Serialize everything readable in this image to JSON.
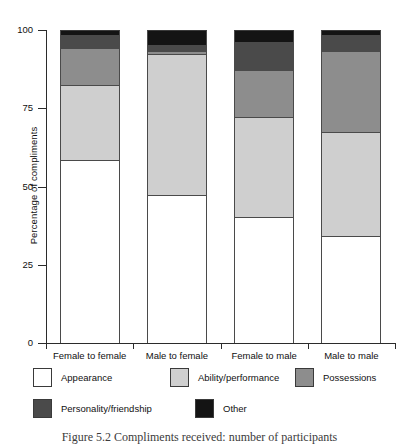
{
  "chart_data": {
    "type": "bar",
    "subtype": "stacked-bar-100-percent",
    "title": "",
    "xlabel": "",
    "ylabel": "Percentage of compliments",
    "ylim": [
      0,
      100
    ],
    "yticks": [
      0,
      25,
      50,
      75,
      100
    ],
    "ytick_labels": [
      "0",
      "25",
      "50",
      "75",
      "100"
    ],
    "grid": false,
    "legend_position": "below-axes",
    "categories": [
      "Female to female",
      "Male to female",
      "Female to male",
      "Male to male"
    ],
    "series": [
      {
        "name": "Appearance",
        "color": "#ffffff",
        "values": [
          58,
          47,
          40,
          34
        ]
      },
      {
        "name": "Ability/performance",
        "color": "#cfcfcf",
        "values": [
          24,
          45,
          32,
          33
        ]
      },
      {
        "name": "Possessions",
        "color": "#8d8d8d",
        "values": [
          12,
          1,
          15,
          26
        ]
      },
      {
        "name": "Personality/friendship",
        "color": "#4a4a4a",
        "values": [
          4,
          2,
          9,
          5
        ]
      },
      {
        "name": "Other",
        "color": "#141414",
        "values": [
          2,
          5,
          4,
          2
        ]
      }
    ]
  },
  "axis": {
    "y_title": "Percentage of compliments"
  },
  "legend": {
    "items": [
      {
        "label": "Appearance",
        "color": "#ffffff"
      },
      {
        "label": "Ability/performance",
        "color": "#cfcfcf"
      },
      {
        "label": "Possessions",
        "color": "#8d8d8d"
      },
      {
        "label": "Personality/friendship",
        "color": "#4a4a4a"
      },
      {
        "label": "Other",
        "color": "#141414"
      }
    ]
  },
  "caption": {
    "text": "Figure 5.2   Compliments received: number of participants"
  }
}
